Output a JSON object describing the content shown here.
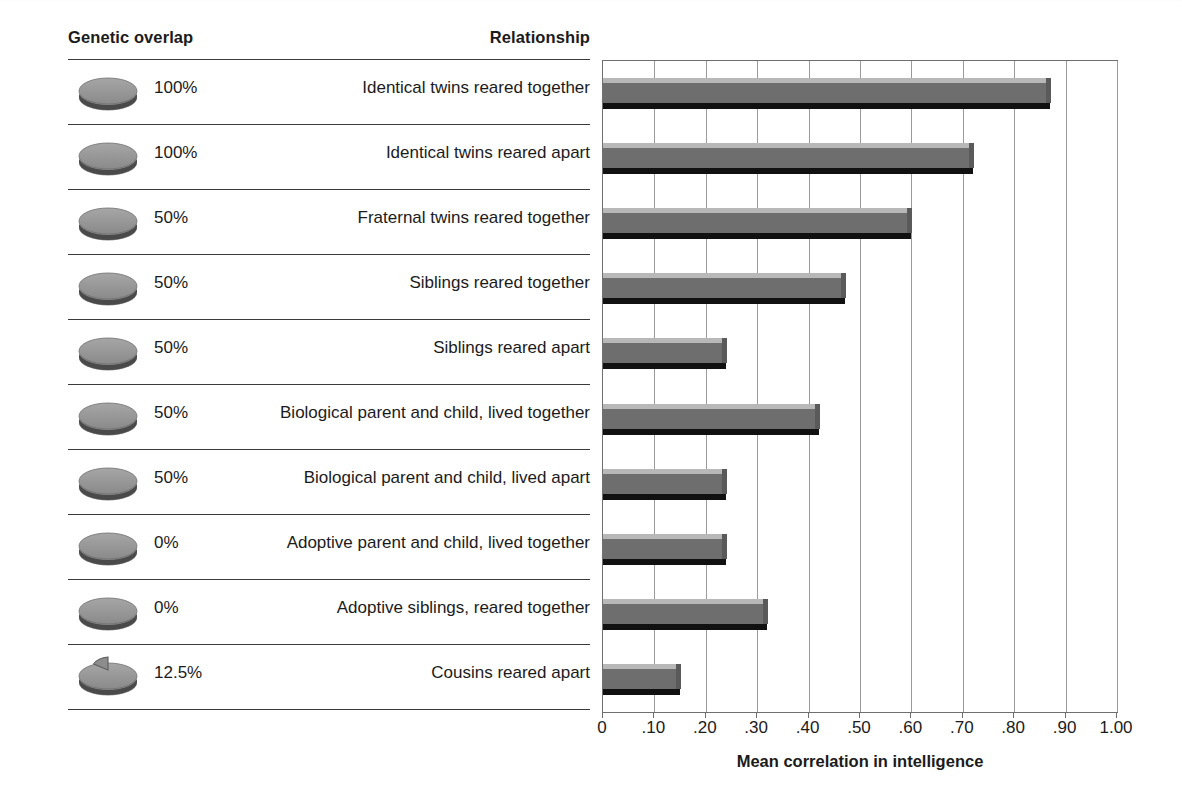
{
  "figure": {
    "headers": {
      "genetic_overlap": "Genetic overlap",
      "relationship": "Relationship"
    },
    "rows": [
      {
        "genetic_overlap": "100%",
        "relationship": "Identical twins reared together",
        "value": 0.87
      },
      {
        "genetic_overlap": "100%",
        "relationship": "Identical twins reared apart",
        "value": 0.72
      },
      {
        "genetic_overlap": "50%",
        "relationship": "Fraternal twins reared together",
        "value": 0.6
      },
      {
        "genetic_overlap": "50%",
        "relationship": "Siblings reared together",
        "value": 0.47
      },
      {
        "genetic_overlap": "50%",
        "relationship": "Siblings reared apart",
        "value": 0.24
      },
      {
        "genetic_overlap": "50%",
        "relationship": "Biological parent and child, lived together",
        "value": 0.42
      },
      {
        "genetic_overlap": "50%",
        "relationship": "Biological parent and child, lived apart",
        "value": 0.24
      },
      {
        "genetic_overlap": "0%",
        "relationship": "Adoptive parent and child, lived together",
        "value": 0.24
      },
      {
        "genetic_overlap": "0%",
        "relationship": "Adoptive siblings, reared together",
        "value": 0.32
      },
      {
        "genetic_overlap": "12.5%",
        "relationship": "Cousins reared apart",
        "value": 0.15
      }
    ],
    "icons": {
      "disc": "disc-icon"
    },
    "colors": {
      "bar_body": "#6e6e6e",
      "bar_top": "#b8b8b8",
      "bar_shadow": "#111111",
      "gridline": "#9a9a9a",
      "axis": "#6f6f6f",
      "text": "#1b1b1b"
    }
  },
  "chart_data": {
    "type": "bar",
    "orientation": "horizontal",
    "title": "",
    "xlabel": "Mean correlation in intelligence",
    "ylabel": "",
    "xlim": [
      0,
      1.0
    ],
    "xticks": [
      0,
      0.1,
      0.2,
      0.3,
      0.4,
      0.5,
      0.6,
      0.7,
      0.8,
      0.9,
      1.0
    ],
    "xtick_labels": [
      "0",
      ".10",
      ".20",
      ".30",
      ".40",
      ".50",
      ".60",
      ".70",
      ".80",
      ".90",
      "1.00"
    ],
    "grid": true,
    "legend": false,
    "categories": [
      "Identical twins reared together",
      "Identical twins reared apart",
      "Fraternal twins reared together",
      "Siblings reared together",
      "Siblings reared apart",
      "Biological parent and child, lived together",
      "Biological parent and child, lived apart",
      "Adoptive parent and child, lived together",
      "Adoptive siblings, reared together",
      "Cousins reared apart"
    ],
    "values": [
      0.87,
      0.72,
      0.6,
      0.47,
      0.24,
      0.42,
      0.24,
      0.24,
      0.32,
      0.15
    ],
    "genetic_overlap": [
      "100%",
      "100%",
      "50%",
      "50%",
      "50%",
      "50%",
      "50%",
      "0%",
      "0%",
      "12.5%"
    ]
  }
}
